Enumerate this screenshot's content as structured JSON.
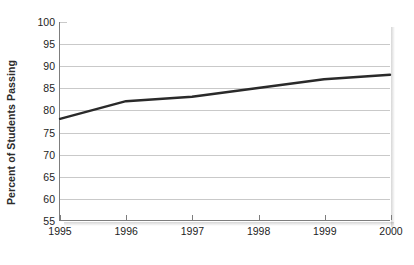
{
  "chart_data": {
    "type": "line",
    "title": "",
    "xlabel": "",
    "ylabel": "Percent of Students Passing",
    "x": [
      1995,
      1996,
      1997,
      1998,
      1999,
      2000
    ],
    "categories": [
      "1995",
      "1996",
      "1997",
      "1998",
      "1999",
      "2000"
    ],
    "values": [
      78,
      82,
      83,
      85,
      87,
      88
    ],
    "series": [
      {
        "name": "Percent of Students Passing",
        "values": [
          78,
          82,
          83,
          85,
          87,
          88
        ]
      }
    ],
    "ylim": [
      55,
      100
    ],
    "yticks": [
      55,
      60,
      65,
      70,
      75,
      80,
      85,
      90,
      95,
      100
    ],
    "ytick_labels": [
      "55",
      "60",
      "65",
      "70",
      "75",
      "80",
      "85",
      "90",
      "95",
      "100"
    ],
    "xlim": [
      1995,
      2000
    ],
    "xticks": [
      1995,
      1996,
      1997,
      1998,
      1999,
      2000
    ],
    "xtick_labels": [
      "1995",
      "1996",
      "1997",
      "1998",
      "1999",
      "2000"
    ],
    "grid": true,
    "grid_axis": "y",
    "legend": false,
    "legend_position": "none",
    "line_color": "#2a2a2a",
    "grid_color": "#c9c9c9",
    "axis_color": "#7d7d7d",
    "background_color": "#ffffff",
    "line_width": 2.4
  }
}
